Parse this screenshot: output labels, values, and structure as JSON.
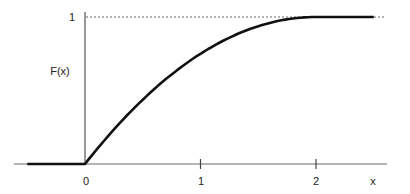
{
  "chart_data": {
    "type": "line",
    "title": "",
    "xlabel": "x",
    "ylabel": "F(x)",
    "xlim": [
      -0.5,
      2.6
    ],
    "ylim": [
      0,
      1
    ],
    "x_ticks": [
      {
        "value": 0,
        "label": "0"
      },
      {
        "value": 1,
        "label": "1"
      },
      {
        "value": 2,
        "label": "2"
      }
    ],
    "y_ticks": [
      {
        "value": 1,
        "label": "1"
      }
    ],
    "reference_lines": [
      {
        "orientation": "horizontal",
        "y": 1,
        "style": "dotted",
        "x_from": 0,
        "x_to": 2.6
      }
    ],
    "grid": false,
    "legend": null,
    "series": [
      {
        "name": "F(x)",
        "description": "Cumulative distribution function: 0 for x<0, x - x^2/4 for 0<=x<=2, 1 for x>2",
        "x": [
          -0.5,
          0,
          0.25,
          0.5,
          0.75,
          1.0,
          1.25,
          1.5,
          1.75,
          2.0,
          2.5
        ],
        "y": [
          0,
          0,
          0.234,
          0.4375,
          0.609,
          0.75,
          0.859,
          0.9375,
          0.984,
          1.0,
          1.0
        ]
      }
    ],
    "colors": {
      "curve": "#111111",
      "axis": "#555555",
      "dotted": "#666666",
      "text": "#222222"
    }
  }
}
